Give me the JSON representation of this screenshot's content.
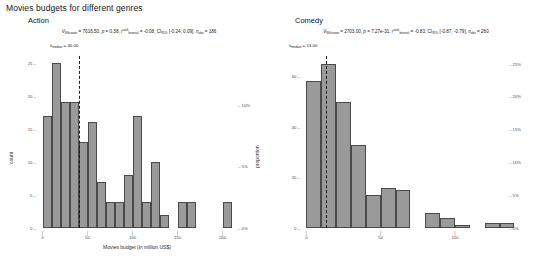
{
  "page": {
    "title": "Movies budgets for different genres",
    "caption": ""
  },
  "panels": [
    {
      "key": "action",
      "title": "Action",
      "stats": {
        "test_statistic_symbol": "V",
        "test_statistic_sub": "Wilcoxon",
        "test_statistic_value": "7616.50",
        "p_label": "p",
        "p_value": "0.38",
        "effect_symbol": "r",
        "effect_sup": "rank",
        "effect_sub": "biserial",
        "effect_value": "-0.08",
        "ci_label": "CI",
        "ci_sub": "95%",
        "ci_value": "[-0.24, 0.09]",
        "n_symbol": "n",
        "n_sub": "obs",
        "n_value": "186"
      },
      "median": {
        "symbol": "x̂",
        "sub": "median",
        "value": "40.00",
        "x": 40
      },
      "chart_data": {
        "type": "bar",
        "title": "Action",
        "xlabel": "Movies budget (in million US$)",
        "ylabel": "count",
        "ylabel_secondary": "proportion",
        "xlim": [
          -5,
          215
        ],
        "ylim": [
          0,
          26
        ],
        "xticks": [
          0,
          50,
          100,
          150,
          200
        ],
        "yticks": [
          0,
          5,
          10,
          15,
          20,
          25
        ],
        "yticks_secondary": [
          "0%",
          "5%",
          "10%"
        ],
        "yticks_secondary_values": [
          0,
          9.3,
          18.6
        ],
        "grid": false,
        "bin_width": 10,
        "bin_starts": [
          0,
          10,
          20,
          30,
          40,
          50,
          60,
          70,
          80,
          90,
          100,
          110,
          120,
          130,
          140,
          150,
          160,
          170,
          180,
          190,
          200
        ],
        "values": [
          17,
          25,
          19,
          19,
          13,
          16,
          7,
          4,
          4,
          8,
          17,
          4,
          10,
          2,
          0,
          4,
          4,
          0,
          0,
          0,
          4
        ]
      }
    },
    {
      "key": "comedy",
      "title": "Comedy",
      "stats": {
        "test_statistic_symbol": "V",
        "test_statistic_sub": "Wilcoxon",
        "test_statistic_value": "2703.00",
        "p_label": "p",
        "p_value": "7.27e-31",
        "effect_symbol": "r",
        "effect_sup": "rank",
        "effect_sub": "biserial",
        "effect_value": "-0.83",
        "ci_label": "CI",
        "ci_sub": "95%",
        "ci_value": "[-0.87, -0.79]",
        "n_symbol": "n",
        "n_sub": "obs",
        "n_value": "260"
      },
      "median": {
        "symbol": "x̂",
        "sub": "median",
        "value": "13.00",
        "x": 13
      },
      "chart_data": {
        "type": "bar",
        "title": "Comedy",
        "xlabel": "Movies budget (in million US$)",
        "ylabel": "count",
        "ylabel_secondary": "proportion",
        "xlim": [
          -3,
          135
        ],
        "ylim": [
          0,
          68
        ],
        "xticks": [
          0,
          50,
          100
        ],
        "yticks": [
          0,
          20,
          40,
          60
        ],
        "yticks_secondary": [
          "0%",
          "5%",
          "10%",
          "15%",
          "20%",
          "25%"
        ],
        "yticks_secondary_values": [
          0,
          13,
          26,
          39,
          52,
          65
        ],
        "grid": false,
        "bin_width": 10,
        "bin_starts": [
          0,
          10,
          20,
          30,
          40,
          50,
          60,
          70,
          80,
          90,
          100,
          110,
          120,
          130
        ],
        "values": [
          58,
          65,
          50,
          33,
          13,
          16,
          15,
          0,
          6,
          4,
          1,
          0,
          2,
          2
        ]
      }
    }
  ]
}
